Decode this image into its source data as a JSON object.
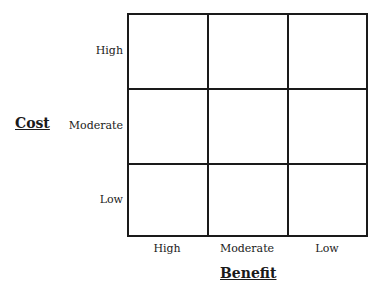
{
  "diagram": {
    "type": "3x3 matrix",
    "y_axis": {
      "title": "Cost",
      "labels": [
        "High",
        "Moderate",
        "Low"
      ]
    },
    "x_axis": {
      "title": "Benefit",
      "labels": [
        "High",
        "Moderate",
        "Low"
      ]
    },
    "cells": [
      [
        "",
        "",
        ""
      ],
      [
        "",
        "",
        ""
      ],
      [
        "",
        "",
        ""
      ]
    ],
    "colors": {
      "line": "#1a1a1a",
      "background": "#ffffff"
    }
  }
}
